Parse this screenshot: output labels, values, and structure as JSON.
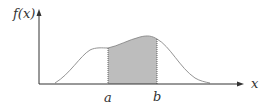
{
  "diagram": {
    "y_axis_label": "f(x)",
    "x_axis_label": "x",
    "bound_a_label": "a",
    "bound_b_label": "b",
    "shaded_region": "area under f(x) between a and b",
    "colors": {
      "axis": "#333333",
      "curve": "#888888",
      "shade": "#bdbdbd",
      "bound_lines": "#555555"
    }
  }
}
